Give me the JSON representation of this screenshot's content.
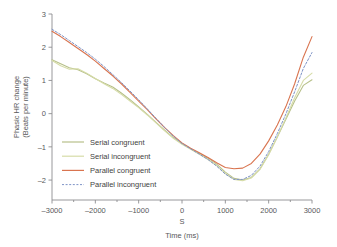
{
  "chart_data": {
    "type": "line",
    "title": "",
    "xlabel": "Time (ms)",
    "ylabel": "Phasic HR change (Beats per minute)",
    "ylabel_line1": "Phasic HR change",
    "ylabel_line2": "(Beats per minute)",
    "xlim": [
      -3000,
      3000
    ],
    "ylim": [
      -2.6,
      3.0
    ],
    "xticks": [
      -3000,
      -2000,
      -1000,
      0,
      1000,
      2000,
      3000
    ],
    "xticklabels": [
      "–3000",
      "–2000",
      "–1000",
      "0",
      "1000",
      "2000",
      "3000"
    ],
    "yticks": [
      3,
      2,
      1,
      0,
      -1,
      -2
    ],
    "yticklabels": [
      "3",
      "2",
      "1",
      "0",
      "–1",
      "–2"
    ],
    "grid": false,
    "legend_position": "center-left",
    "annotations": [
      {
        "text": "S",
        "x": 0,
        "y": -2.95,
        "note": "stimulus onset marker below zero tick"
      }
    ],
    "x": [
      -3000,
      -2800,
      -2600,
      -2400,
      -2200,
      -2000,
      -1800,
      -1600,
      -1400,
      -1200,
      -1000,
      -800,
      -600,
      -400,
      -200,
      0,
      200,
      400,
      600,
      800,
      1000,
      1200,
      1400,
      1600,
      1800,
      2000,
      2200,
      2400,
      2600,
      2800,
      3000
    ],
    "series": [
      {
        "name": "Serial congruent",
        "color": "#b7c08a",
        "style": "solid",
        "values": [
          1.62,
          1.5,
          1.38,
          1.32,
          1.2,
          1.05,
          0.92,
          0.8,
          0.62,
          0.42,
          0.2,
          -0.02,
          -0.26,
          -0.5,
          -0.72,
          -0.9,
          -1.06,
          -1.2,
          -1.34,
          -1.52,
          -1.76,
          -1.95,
          -2.0,
          -1.92,
          -1.66,
          -1.22,
          -0.7,
          -0.16,
          0.38,
          0.85,
          1.02
        ]
      },
      {
        "name": "Serial incongruent",
        "color": "#d6dca8",
        "style": "solid",
        "values": [
          1.6,
          1.44,
          1.34,
          1.35,
          1.22,
          1.06,
          0.9,
          0.76,
          0.58,
          0.38,
          0.18,
          -0.04,
          -0.28,
          -0.52,
          -0.74,
          -0.92,
          -1.07,
          -1.22,
          -1.38,
          -1.56,
          -1.8,
          -1.98,
          -2.02,
          -1.94,
          -1.68,
          -1.24,
          -0.7,
          -0.12,
          0.48,
          1.0,
          1.22
        ]
      },
      {
        "name": "Parallel congruent",
        "color": "#d9744f",
        "style": "solid",
        "values": [
          2.48,
          2.32,
          2.14,
          1.96,
          1.78,
          1.58,
          1.36,
          1.14,
          0.9,
          0.64,
          0.38,
          0.12,
          -0.16,
          -0.42,
          -0.66,
          -0.88,
          -1.04,
          -1.18,
          -1.32,
          -1.48,
          -1.62,
          -1.66,
          -1.64,
          -1.5,
          -1.22,
          -0.82,
          -0.34,
          0.22,
          0.9,
          1.7,
          2.32
        ]
      },
      {
        "name": "Parallel incongruent",
        "color": "#7e93c6",
        "style": "dashed",
        "values": [
          2.54,
          2.38,
          2.2,
          2.02,
          1.84,
          1.64,
          1.42,
          1.18,
          0.94,
          0.68,
          0.42,
          0.14,
          -0.14,
          -0.42,
          -0.68,
          -0.9,
          -1.06,
          -1.22,
          -1.38,
          -1.58,
          -1.82,
          -1.98,
          -1.98,
          -1.86,
          -1.58,
          -1.14,
          -0.6,
          0.0,
          0.66,
          1.36,
          1.84
        ]
      }
    ],
    "legend_entries": [
      {
        "label": "Serial congruent",
        "color": "#b7c08a",
        "style": "solid"
      },
      {
        "label": "Serial incongruent",
        "color": "#d6dca8",
        "style": "solid"
      },
      {
        "label": "Parallel congruent",
        "color": "#d9744f",
        "style": "solid"
      },
      {
        "label": "Parallel incongruent",
        "color": "#7e93c6",
        "style": "dashed"
      }
    ]
  }
}
